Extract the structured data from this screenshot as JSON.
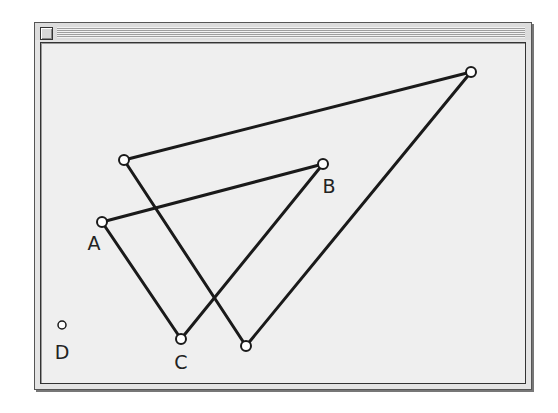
{
  "window": {
    "title": "",
    "close_box": "close-box"
  },
  "geometry": {
    "points": [
      {
        "id": "A",
        "label": "A",
        "x": 102,
        "y": 222,
        "label_x": 94,
        "label_y": 250
      },
      {
        "id": "B",
        "label": "B",
        "x": 323,
        "y": 164,
        "label_x": 329,
        "label_y": 193
      },
      {
        "id": "C",
        "label": "C",
        "x": 181,
        "y": 339,
        "label_x": 181,
        "label_y": 369
      },
      {
        "id": "D",
        "label": "D",
        "x": 62,
        "y": 325,
        "label_x": 62,
        "label_y": 359
      },
      {
        "id": "P1",
        "label": "",
        "x": 124,
        "y": 160
      },
      {
        "id": "P2",
        "label": "",
        "x": 471,
        "y": 72
      },
      {
        "id": "P3",
        "label": "",
        "x": 246,
        "y": 346
      }
    ],
    "segments": [
      {
        "from": "A",
        "to": "B"
      },
      {
        "from": "B",
        "to": "C"
      },
      {
        "from": "C",
        "to": "A"
      },
      {
        "from": "P1",
        "to": "P2"
      },
      {
        "from": "P2",
        "to": "P3"
      },
      {
        "from": "P3",
        "to": "P1"
      }
    ],
    "colors": {
      "line": "#1a1a1a",
      "point_fill": "#ffffff",
      "background": "#efefef"
    }
  }
}
